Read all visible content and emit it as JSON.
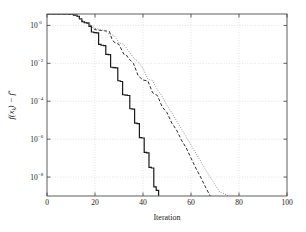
{
  "figure": {
    "background_color": "#ffffff",
    "axes_color": "#4d4d4d",
    "grid_color": "#c8c8c8"
  },
  "chart_data": {
    "type": "line",
    "title": "",
    "subtitle": "",
    "xlabel": "Iteration",
    "ylabel": "f(x_k) - f*",
    "ylabel_parts": {
      "f1": "f",
      "open": "(",
      "x": "x",
      "sub": "k",
      "close": ")",
      "minus": "−",
      "f2": "f",
      "star": "*"
    },
    "xscale": "linear",
    "yscale": "log",
    "xlim": [
      0,
      100
    ],
    "ylim": [
      1e-09,
      4
    ],
    "grid": true,
    "legend_position": "none",
    "xticks": [
      0,
      20,
      40,
      60,
      80,
      100
    ],
    "xticklabels": [
      "0",
      "20",
      "40",
      "60",
      "80",
      "100"
    ],
    "yticks": [
      1,
      0.01,
      0.0001,
      1e-06,
      1e-08
    ],
    "yticklabels": [
      "10^0",
      "10^-2",
      "10^-4",
      "10^-6",
      "10^-8"
    ],
    "ytick_mantissa": "10",
    "ytick_exponents": [
      "0",
      "−2",
      "−4",
      "−6",
      "−8"
    ],
    "series": [
      {
        "name": "solid",
        "style": "solid",
        "color": "#1a1a1a",
        "width": 1.2,
        "x": [
          0,
          2,
          4,
          6,
          8,
          10,
          12,
          13,
          14,
          15,
          16,
          17,
          18,
          19,
          20,
          21,
          22,
          23,
          24,
          25,
          26,
          27,
          28,
          29,
          30,
          31,
          32,
          33,
          34,
          35,
          36,
          37,
          38,
          39,
          40,
          41,
          42,
          43,
          44,
          45,
          46,
          47
        ],
        "y": [
          4.0,
          4.0,
          4.0,
          4.0,
          4.0,
          3.9,
          3.5,
          3.0,
          2.2,
          1.6,
          1.4,
          1.35,
          0.9,
          0.45,
          0.42,
          0.4,
          0.1,
          0.09,
          0.085,
          0.03,
          0.029,
          0.0062,
          0.006,
          0.0058,
          0.0012,
          0.0011,
          0.00022,
          0.00021,
          0.0002,
          4e-05,
          3.8e-05,
          7e-06,
          6.6e-06,
          1.2e-06,
          1.15e-06,
          2e-07,
          1.9e-07,
          3.2e-08,
          3e-08,
          3e-09,
          2e-09,
          6e-10
        ]
      },
      {
        "name": "dashed",
        "style": "dashed",
        "color": "#2b2b2b",
        "width": 1.0,
        "x": [
          0,
          2,
          4,
          6,
          8,
          10,
          12,
          13,
          14,
          15,
          16,
          17,
          18,
          19,
          20,
          22,
          24,
          25,
          26,
          27,
          28,
          30,
          32,
          33,
          34,
          36,
          38,
          40,
          42,
          44,
          46,
          48,
          50,
          52,
          54,
          56,
          58,
          60,
          62,
          64,
          66,
          68,
          70,
          71
        ],
        "y": [
          4.0,
          4.0,
          4.0,
          4.0,
          4.0,
          3.9,
          3.5,
          3.0,
          2.2,
          1.6,
          1.4,
          1.3,
          1.1,
          0.75,
          0.6,
          0.55,
          0.52,
          0.5,
          0.48,
          0.2,
          0.13,
          0.1,
          0.03,
          0.028,
          0.018,
          0.01,
          0.0022,
          0.0013,
          0.0012,
          0.00028,
          0.0002,
          5e-05,
          2.5e-05,
          7e-06,
          3e-06,
          9e-07,
          3.5e-07,
          1e-07,
          3e-08,
          1e-08,
          3e-09,
          1e-09,
          5e-10,
          4e-10
        ]
      },
      {
        "name": "dotted",
        "style": "dotted",
        "color": "#8c8c8c",
        "width": 1.0,
        "x": [
          0,
          2,
          4,
          6,
          8,
          10,
          12,
          13,
          14,
          15,
          16,
          17,
          18,
          19,
          20,
          22,
          24,
          26,
          28,
          30,
          32,
          34,
          36,
          38,
          40,
          42,
          44,
          46,
          48,
          50,
          52,
          54,
          56,
          58,
          60,
          62,
          64,
          66,
          68,
          70,
          72,
          74,
          76,
          78,
          80,
          82,
          84,
          86,
          88
        ],
        "y": [
          4.0,
          4.0,
          4.0,
          4.0,
          4.0,
          3.9,
          3.5,
          3.0,
          2.2,
          1.7,
          1.5,
          1.4,
          1.2,
          0.9,
          0.7,
          0.6,
          0.55,
          0.33,
          0.3,
          0.12,
          0.1,
          0.045,
          0.02,
          0.012,
          0.0055,
          0.0015,
          0.0012,
          0.0004,
          0.00018,
          6e-05,
          2.5e-05,
          9e-06,
          3.5e-06,
          1.3e-06,
          5e-07,
          1.8e-07,
          7e-08,
          2.5e-08,
          1e-08,
          4e-09,
          1.6e-09,
          1.3e-09,
          9e-10,
          7e-10,
          5.5e-10,
          4.5e-10,
          4e-10,
          3.6e-10,
          3.4e-10
        ]
      }
    ]
  }
}
